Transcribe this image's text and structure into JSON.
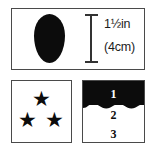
{
  "figure": {
    "background_color": "#ffffff",
    "ink_color": "#0c0c0c",
    "panels": {
      "size_panel": {
        "name": "oval size reference",
        "oval_icon": "filled-oval-shape",
        "dimension_icon": "vertical-dimension-bar",
        "measurement_imperial": "1½in",
        "measurement_metric": "(4cm)"
      },
      "stars_panel": {
        "name": "three star rating",
        "star_glyph": "★",
        "stars": [
          {
            "label": "star-top"
          },
          {
            "label": "star-bottom-left"
          },
          {
            "label": "star-bottom-right"
          }
        ]
      },
      "levels_panel": {
        "name": "fill level scale",
        "wave_icon": "wavy-fill-line",
        "levels": [
          {
            "value": "1",
            "filled": true
          },
          {
            "value": "2",
            "filled": false
          },
          {
            "value": "3",
            "filled": false
          }
        ]
      }
    }
  }
}
